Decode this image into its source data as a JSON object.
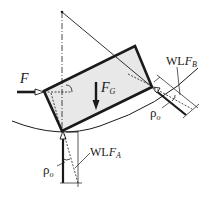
{
  "diagram": {
    "type": "statics free-body diagram",
    "labels": {
      "force_F": "F",
      "weight": {
        "main": "F",
        "sub": "G"
      },
      "rho_left": {
        "main": "ρ",
        "sub": "o"
      },
      "rho_right": {
        "main": "ρ",
        "sub": "o"
      },
      "wlf_a": {
        "main": "WL",
        "ital": "F",
        "sub": "A"
      },
      "wlf_b": {
        "main": "WL",
        "ital": "F",
        "sub": "B"
      }
    },
    "colors": {
      "stroke": "#1a1a1a",
      "block_fill": "#e8e8e8",
      "thin_line": "#333333"
    }
  }
}
